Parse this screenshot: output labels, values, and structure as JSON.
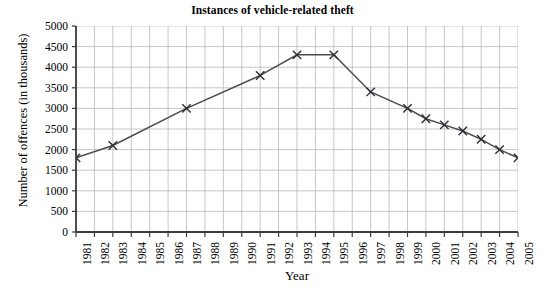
{
  "chart_data": {
    "type": "line",
    "title": "Instances of vehicle-related theft",
    "xlabel": "Year",
    "ylabel": "Number of offences (in thousands)",
    "x": [
      1981,
      1983,
      1987,
      1991,
      1993,
      1995,
      1997,
      1999,
      2000,
      2001,
      2002,
      2003,
      2004,
      2005
    ],
    "values": [
      1800,
      2100,
      3000,
      3800,
      4300,
      4300,
      3400,
      3000,
      2750,
      2600,
      2450,
      2250,
      2000,
      1800
    ],
    "series": [
      {
        "name": "Instances of vehicle-related theft",
        "points": [
          {
            "year": 1981,
            "value": 1800
          },
          {
            "year": 1983,
            "value": 2100
          },
          {
            "year": 1987,
            "value": 3000
          },
          {
            "year": 1991,
            "value": 3800
          },
          {
            "year": 1993,
            "value": 4300
          },
          {
            "year": 1995,
            "value": 4300
          },
          {
            "year": 1997,
            "value": 3400
          },
          {
            "year": 1999,
            "value": 3000
          },
          {
            "year": 2000,
            "value": 2750
          },
          {
            "year": 2001,
            "value": 2600
          },
          {
            "year": 2002,
            "value": 2450
          },
          {
            "year": 2003,
            "value": 2250
          },
          {
            "year": 2004,
            "value": 2000
          },
          {
            "year": 2005,
            "value": 1800
          }
        ]
      }
    ],
    "xlim": [
      1981,
      2005
    ],
    "ylim": [
      0,
      5000
    ],
    "ytick_labels": [
      "0",
      "500",
      "1000",
      "1500",
      "2000",
      "2500",
      "3000",
      "3500",
      "4000",
      "4500",
      "5000"
    ],
    "ytick_values": [
      0,
      500,
      1000,
      1500,
      2000,
      2500,
      3000,
      3500,
      4000,
      4500,
      5000
    ],
    "xtick_labels": [
      "1981",
      "1982",
      "1983",
      "1984",
      "1985",
      "1986",
      "1987",
      "1988",
      "1989",
      "1990",
      "1991",
      "1992",
      "1993",
      "1994",
      "1995",
      "1996",
      "1997",
      "1998",
      "1999",
      "2000",
      "2001",
      "2002",
      "2003",
      "2004",
      "2005"
    ],
    "grid": true,
    "legend": "none",
    "marker": "x",
    "line_color": "#4a4a52",
    "grid_color": "#b9b9bd",
    "axis_color": "#3c3c3c",
    "marker_color": "#2d2d33"
  }
}
